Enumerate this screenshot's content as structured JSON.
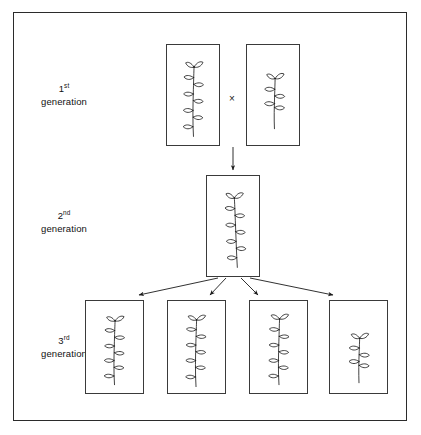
{
  "figure": {
    "frame_color": "#2b2b2b",
    "box_color": "#3a3a3a",
    "ink_color": "#1a1a1a",
    "background": "#ffffff"
  },
  "labels": [
    {
      "ordinal": "1",
      "suffix": "st",
      "word": "generation"
    },
    {
      "ordinal": "2",
      "suffix": "nd",
      "word": "generation"
    },
    {
      "ordinal": "3",
      "suffix": "rd",
      "word": "generation"
    }
  ],
  "cross": {
    "symbol": "×"
  },
  "generation1": {
    "boxes": [
      {
        "plant": "tall-plant",
        "leaf_pairs": 5,
        "description": "tall plant with many leaves"
      },
      {
        "plant": "short-plant",
        "leaf_pairs": 2,
        "description": "short plant with few leaves"
      }
    ]
  },
  "generation2": {
    "boxes": [
      {
        "plant": "tall-plant",
        "leaf_pairs": 5,
        "description": "tall hybrid plant"
      }
    ]
  },
  "generation3": {
    "boxes": [
      {
        "plant": "tall-plant",
        "leaf_pairs": 5,
        "description": "tall plant"
      },
      {
        "plant": "tall-plant",
        "leaf_pairs": 5,
        "description": "tall plant"
      },
      {
        "plant": "tall-plant",
        "leaf_pairs": 5,
        "description": "tall plant"
      },
      {
        "plant": "short-plant",
        "leaf_pairs": 2,
        "description": "short plant"
      }
    ]
  },
  "arrows": {
    "gen1_to_gen2": 1,
    "gen2_to_gen3": 4
  }
}
